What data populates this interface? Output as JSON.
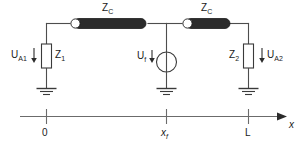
{
  "diagram": {
    "type": "electrical-circuit-schematic",
    "colors": {
      "wire": "#4d4d4d",
      "line_element_fill": "#2b2b2b",
      "line_element_end_fill": "#ffffff",
      "text": "#1a1a1a",
      "background": "#ffffff",
      "axis": "#6b6b6b"
    },
    "labels": {
      "zc_left": {
        "base": "Z",
        "sub": "C"
      },
      "zc_right": {
        "base": "Z",
        "sub": "C"
      },
      "ua1": {
        "base": "U",
        "sub": "A1"
      },
      "z1": {
        "base": "Z",
        "sub": "1"
      },
      "uf": {
        "base": "U",
        "sub": "f"
      },
      "z2": {
        "base": "Z",
        "sub": "2"
      },
      "ua2": {
        "base": "U",
        "sub": "A2"
      }
    },
    "axis": {
      "name": "x-position-axis",
      "axis_label": "x",
      "ticks": [
        {
          "label": "0",
          "sub": "",
          "x": 46
        },
        {
          "label": "x",
          "sub": "f",
          "x": 166
        },
        {
          "label": "L",
          "sub": "",
          "x": 248
        }
      ]
    },
    "components": [
      {
        "name": "transmission-line-left",
        "label": "Z_C",
        "from_x": 46,
        "to_x": 166
      },
      {
        "name": "transmission-line-right",
        "label": "Z_C",
        "from_x": 176,
        "to_x": 248
      },
      {
        "name": "impedance-z1",
        "label": "Z_1",
        "voltage": "U_A1",
        "x": 46
      },
      {
        "name": "fault-source-uf",
        "label": "U_f",
        "x": 166
      },
      {
        "name": "impedance-z2",
        "label": "Z_2",
        "voltage": "U_A2",
        "x": 248
      }
    ]
  }
}
